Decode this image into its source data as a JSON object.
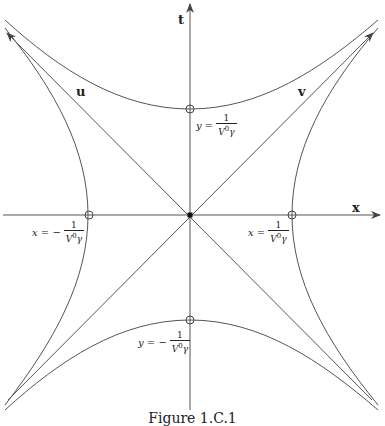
{
  "figure": {
    "caption": "Figure 1.C.1",
    "axes": {
      "horizontal_label": "x",
      "vertical_label": "t"
    },
    "lines": {
      "u_label": "u",
      "v_label": "v"
    },
    "annotations": {
      "top": {
        "lhs": "y =",
        "num": "1",
        "den_base": "V",
        "den_sup": "0",
        "den_tail": "γ"
      },
      "bottom": {
        "lhs": "y = −",
        "num": "1",
        "den_base": "V",
        "den_sup": "0",
        "den_tail": "γ"
      },
      "left": {
        "lhs": "x = −",
        "num": "1",
        "den_base": "V",
        "den_sup": "0",
        "den_tail": "γ"
      },
      "right": {
        "lhs": "x =",
        "num": "1",
        "den_base": "V",
        "den_sup": "0",
        "den_tail": "γ"
      }
    },
    "geometry": {
      "origin": [
        190,
        215
      ],
      "vertex_x_offset": 102,
      "vertex_y_offset": 106
    },
    "colors": {
      "stroke": "#555555",
      "text": "#222222"
    }
  }
}
